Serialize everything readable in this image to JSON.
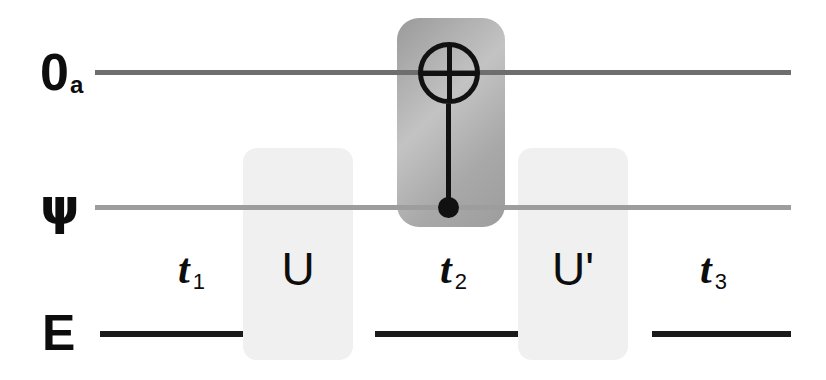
{
  "diagram": {
    "wires": [
      {
        "id": "ancilla",
        "label": "0",
        "sublabel": "a",
        "color": "#6e6e6e"
      },
      {
        "id": "system",
        "label": "ψ",
        "sublabel": "",
        "color": "#9d9d9d"
      },
      {
        "id": "environment",
        "label": "E",
        "sublabel": "",
        "color": "#1a1a1a"
      }
    ],
    "captions": [
      {
        "id": "t1",
        "text": "t",
        "sub": "1",
        "kind": "time"
      },
      {
        "id": "u",
        "text": "U",
        "sub": "",
        "kind": "gate"
      },
      {
        "id": "t2",
        "text": "t",
        "sub": "2",
        "kind": "time"
      },
      {
        "id": "u2",
        "text": "U'",
        "sub": "",
        "kind": "gate"
      },
      {
        "id": "t3",
        "text": "t",
        "sub": "3",
        "kind": "time"
      }
    ],
    "gates": [
      {
        "id": "u-box",
        "label": "U",
        "shade": "#f0f0f0"
      },
      {
        "id": "cnot-box",
        "label": "t2",
        "shade": "#a8a8a8"
      },
      {
        "id": "uprime-box",
        "label": "U'",
        "shade": "#f0f0f0"
      }
    ],
    "cnot": {
      "target_symbol": "⊕",
      "target_wire": "ancilla",
      "control_wire": "system",
      "color": "#111111"
    }
  }
}
